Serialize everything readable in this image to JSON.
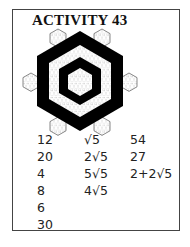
{
  "title": "ACTIVITY 43",
  "figure": {
    "colors": {
      "ink": "#000000",
      "grid": "#9a9a9a",
      "background": "#ffffff"
    }
  },
  "answers": {
    "column1": [
      "12",
      "20",
      "4",
      "8",
      "6",
      "30"
    ],
    "column2": [
      "√5",
      "2√5",
      "5√5",
      "4√5"
    ],
    "column3": [
      "54",
      "27",
      "2+2√5"
    ]
  }
}
